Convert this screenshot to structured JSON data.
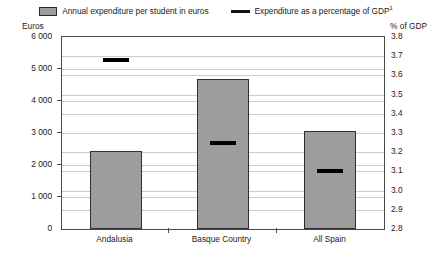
{
  "legend": {
    "bar_series_label": "Annual expenditure per student in euros",
    "line_series_label": "Expenditure as a percentage of GDP",
    "line_series_footnote": "1"
  },
  "axes": {
    "left_caption": "Euros",
    "right_caption": "% of GDP",
    "left_ticks": [
      "6 000",
      "5 000",
      "4 000",
      "3 000",
      "2 000",
      "1 000",
      "0"
    ],
    "right_ticks": [
      "3.8",
      "3.7",
      "3.6",
      "3.5",
      "3.4",
      "3.3",
      "3.2",
      "3.1",
      "3.0",
      "2.9",
      "2.8"
    ]
  },
  "categories": [
    "Andalusia",
    "Basque Country",
    "All Spain"
  ],
  "colors": {
    "bar_fill": "#9d9d9d",
    "bar_stroke": "#2f2f2f",
    "marker": "#000000",
    "gridline": "#cccccc",
    "frame": "#4a4a4a"
  },
  "chart_data": {
    "type": "bar",
    "title": "",
    "subtitle": "",
    "xlabel": "",
    "ylabel": "Euros",
    "y2label": "% of GDP",
    "categories": [
      "Andalusia",
      "Basque Country",
      "All Spain"
    ],
    "grid": true,
    "legend_position": "top-center",
    "series": [
      {
        "name": "Annual expenditure per student in euros",
        "type": "bar",
        "axis": "left",
        "values": [
          2450,
          4700,
          3050
        ]
      },
      {
        "name": "Expenditure as a percentage of GDP",
        "type": "marker",
        "axis": "right",
        "values": [
          3.68,
          3.25,
          3.1
        ]
      }
    ],
    "ylim": [
      0,
      6000
    ],
    "ytick_step": 1000,
    "y2lim": [
      2.8,
      3.8
    ],
    "y2tick_step": 0.1,
    "ytick_labels": [
      "0",
      "1 000",
      "2 000",
      "3 000",
      "4 000",
      "5 000",
      "6 000"
    ],
    "y2tick_labels": [
      "2.8",
      "2.9",
      "3.0",
      "3.1",
      "3.2",
      "3.3",
      "3.4",
      "3.5",
      "3.6",
      "3.7",
      "3.8"
    ]
  }
}
